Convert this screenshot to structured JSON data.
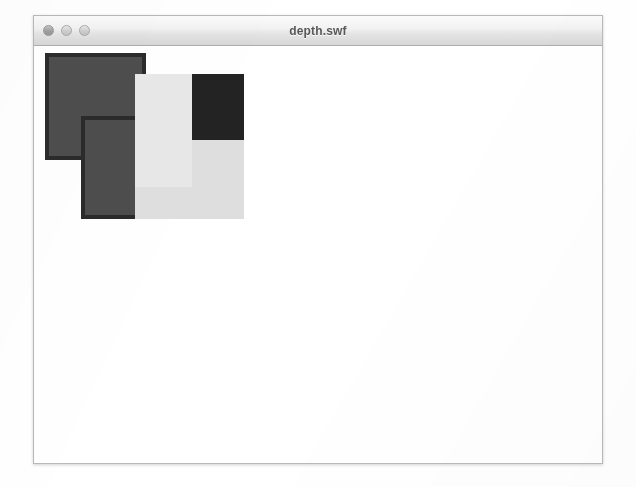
{
  "window": {
    "title": "depth.swf",
    "controls": [
      {
        "name": "close-button",
        "label": "Close",
        "color": "#9f9f9f"
      },
      {
        "name": "minimize-button",
        "label": "Minimize",
        "color": "#cfcfcf"
      },
      {
        "name": "zoom-button",
        "label": "Zoom",
        "color": "#cfcfcf"
      }
    ],
    "frame_color": "#b9b9b9",
    "titlebar_top_color": "#fbfbfb",
    "titlebar_bottom_color": "#d7d7d7",
    "content_background": "#ffffff"
  },
  "stage": {
    "background": "#ffffff",
    "shapes": [
      {
        "name": "square-back-gray",
        "label": "Back gray square",
        "x": 11,
        "y": 7,
        "width": 101,
        "height": 107,
        "fill": "#4d4d4d",
        "border": "#2b2b2b",
        "border_width": 4,
        "depth": 1
      },
      {
        "name": "square-dark",
        "label": "Dark square",
        "x": 101,
        "y": 28,
        "width": 109,
        "height": 113,
        "fill": "#232323",
        "border": "#232323",
        "border_width": 0,
        "depth": 2
      },
      {
        "name": "square-front-gray",
        "label": "Front gray square",
        "x": 47,
        "y": 70,
        "width": 111,
        "height": 103,
        "fill": "#4d4d4d",
        "border": "#2b2b2b",
        "border_width": 4,
        "depth": 3
      },
      {
        "name": "square-light",
        "label": "Light square",
        "x": 101,
        "y": 28,
        "width": 57,
        "height": 113,
        "fill": "#e7e7e7",
        "border": "#e7e7e7",
        "border_width": 0,
        "depth": 4
      },
      {
        "name": "square-light-lower",
        "label": "Light square lower block",
        "x": 101,
        "y": 141,
        "width": 57,
        "height": 32,
        "fill": "#dedede",
        "border": "#dedede",
        "border_width": 0,
        "depth": 5
      },
      {
        "name": "square-light-wide",
        "label": "Light square wide block",
        "x": 158,
        "y": 94,
        "width": 52,
        "height": 79,
        "fill": "#dedede",
        "border": "#dedede",
        "border_width": 0,
        "depth": 6
      }
    ]
  }
}
